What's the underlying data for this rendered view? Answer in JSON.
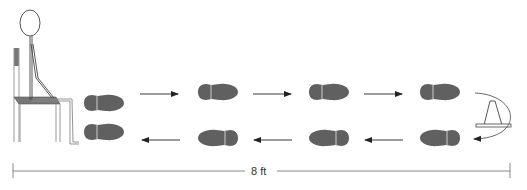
{
  "diagram": {
    "title": "",
    "distance_label": "8 ft",
    "colors": {
      "footprint": "#606060",
      "line": "#333333",
      "light_line": "#888888",
      "seat": "#777777"
    },
    "elements": {
      "person": "seated stick figure on chair",
      "cone": "traffic cone turnaround marker",
      "footprints_outbound": 5,
      "footprints_return": 5,
      "arrows_outbound": 3,
      "arrows_return": 3
    }
  }
}
